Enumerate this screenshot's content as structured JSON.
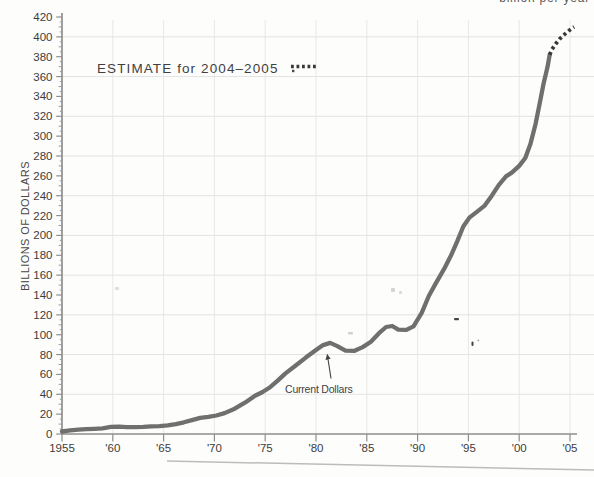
{
  "page": {
    "top_text_fragment": "billion per year",
    "background": "#fdfdfc"
  },
  "chart_data": {
    "type": "line",
    "title": "",
    "xlabel": "",
    "ylabel": "BILLIONS OF DOLLARS",
    "xlim": [
      1955,
      2005.5
    ],
    "ylim": [
      0,
      420
    ],
    "y_ticks": [
      0,
      20,
      40,
      60,
      80,
      100,
      120,
      140,
      160,
      180,
      200,
      220,
      240,
      260,
      280,
      300,
      320,
      340,
      360,
      380,
      400,
      420
    ],
    "x_tick_years": [
      1955,
      1960,
      1965,
      1970,
      1975,
      1980,
      1985,
      1990,
      1995,
      2000,
      2005
    ],
    "x_tick_labels": [
      "1955",
      "'60",
      "'65",
      "'70",
      "'75",
      "'80",
      "'85",
      "'90",
      "'95",
      "'00",
      "'05"
    ],
    "grid": {
      "h_values": [
        40,
        80,
        120,
        160,
        200,
        240,
        280,
        320,
        360,
        400
      ],
      "v_years": [
        1960,
        1965,
        1970,
        1975,
        1980,
        1985,
        1990,
        1995,
        2000,
        2005
      ]
    },
    "legend": {
      "label": "ESTIMATE for 2004–2005",
      "style": "dotted",
      "position": "upper-left"
    },
    "annotation": {
      "label": "Current Dollars",
      "points_at_year": 1981
    },
    "series": [
      {
        "name": "Current Dollars",
        "style": "solid",
        "color": "#6f6f6f",
        "points": [
          [
            1955,
            2.5
          ],
          [
            1955.8,
            3.6
          ],
          [
            1956.6,
            4.4
          ],
          [
            1957.4,
            4.9
          ],
          [
            1958.2,
            5.2
          ],
          [
            1959,
            5.6
          ],
          [
            1959.8,
            7.2
          ],
          [
            1960.6,
            7.4
          ],
          [
            1961.4,
            6.8
          ],
          [
            1962.2,
            6.9
          ],
          [
            1963,
            7.3
          ],
          [
            1963.8,
            7.8
          ],
          [
            1964.6,
            8
          ],
          [
            1965.4,
            8.7
          ],
          [
            1966.2,
            10
          ],
          [
            1967,
            11.8
          ],
          [
            1967.8,
            14
          ],
          [
            1968.6,
            16.2
          ],
          [
            1969.4,
            17.2
          ],
          [
            1970.2,
            18.6
          ],
          [
            1971,
            21
          ],
          [
            1972,
            25.5
          ],
          [
            1973,
            31.5
          ],
          [
            1974,
            38.5
          ],
          [
            1974.7,
            42
          ],
          [
            1975.4,
            46.5
          ],
          [
            1976.2,
            53.5
          ],
          [
            1977,
            61
          ],
          [
            1978,
            69
          ],
          [
            1979,
            77
          ],
          [
            1980,
            84.5
          ],
          [
            1980.7,
            89.5
          ],
          [
            1981.4,
            91.8
          ],
          [
            1982.1,
            88.5
          ],
          [
            1982.9,
            84
          ],
          [
            1983.8,
            83.8
          ],
          [
            1984.6,
            87.5
          ],
          [
            1985.4,
            93
          ],
          [
            1986.2,
            101.5
          ],
          [
            1986.9,
            107.8
          ],
          [
            1987.5,
            108.8
          ],
          [
            1988.1,
            105.2
          ],
          [
            1988.9,
            104.8
          ],
          [
            1989.6,
            108.5
          ],
          [
            1990.4,
            122
          ],
          [
            1991.1,
            139
          ],
          [
            1991.8,
            152
          ],
          [
            1992.6,
            166
          ],
          [
            1993.3,
            180
          ],
          [
            1993.9,
            194
          ],
          [
            1994.5,
            209
          ],
          [
            1995.1,
            218
          ],
          [
            1995.8,
            223.5
          ],
          [
            1996.6,
            230
          ],
          [
            1997.3,
            240
          ],
          [
            1998,
            251
          ],
          [
            1998.7,
            259.5
          ],
          [
            1999.3,
            263.5
          ],
          [
            2000,
            270
          ],
          [
            2000.6,
            278
          ],
          [
            2001.1,
            292
          ],
          [
            2001.6,
            312
          ],
          [
            2002,
            332
          ],
          [
            2002.4,
            353
          ],
          [
            2002.8,
            370
          ],
          [
            2003,
            382
          ]
        ]
      },
      {
        "name": "Estimate for 2004–2005",
        "style": "dotted",
        "color": "#383838",
        "points": [
          [
            2003,
            382
          ],
          [
            2003.2,
            387
          ],
          [
            2003.6,
            393
          ],
          [
            2004,
            398
          ],
          [
            2004.4,
            402
          ],
          [
            2004.8,
            405.5
          ],
          [
            2005.1,
            408
          ],
          [
            2005.4,
            410
          ]
        ]
      }
    ]
  },
  "colors": {
    "axis": "#8e8e8e",
    "grid": "#e5e5e5",
    "text": "#3d3d3d",
    "line": "#6f6f6f",
    "estimate": "#383838",
    "bottom_rule": "#bcbcbc"
  }
}
